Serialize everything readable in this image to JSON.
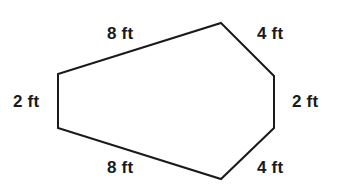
{
  "figure": {
    "type": "geometry-diagram",
    "shape_name": "hexagon",
    "background_color": "#ffffff",
    "stroke_color": "#1a1a1a",
    "stroke_width": 2,
    "fill_color": "none",
    "unit": "ft",
    "vertices": [
      {
        "name": "top-apex",
        "x": 221,
        "y": 23
      },
      {
        "name": "right-upper",
        "x": 274,
        "y": 76
      },
      {
        "name": "right-lower",
        "x": 274,
        "y": 128
      },
      {
        "name": "bottom-apex",
        "x": 221,
        "y": 179
      },
      {
        "name": "left-lower",
        "x": 58,
        "y": 128
      },
      {
        "name": "left-upper",
        "x": 58,
        "y": 74
      }
    ],
    "points_attr": "221,23 274,76 274,128 221,179 58,128 58,74",
    "labels": {
      "top_left": "8 ft",
      "top_right": "4 ft",
      "left": "2 ft",
      "right": "2 ft",
      "bottom_left": "8 ft",
      "bottom_right": "4 ft"
    }
  }
}
